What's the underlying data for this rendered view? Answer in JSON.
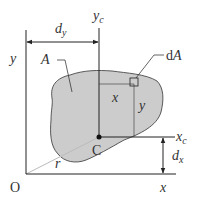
{
  "diagram": {
    "colors": {
      "line": "#222222",
      "area_fill": "#cccccc",
      "radius_line": "#bbbbbb",
      "text": "#333333"
    },
    "labels": {
      "y_axis": "y",
      "x_axis": "x",
      "origin": "O",
      "yc_axis_main": "y",
      "yc_axis_sub": "c",
      "xc_axis_main": "x",
      "xc_axis_sub": "c",
      "dy_main": "d",
      "dy_sub": "y",
      "dx_main": "d",
      "dx_sub": "x",
      "area": "A",
      "centroid": "C",
      "element_prefix": "d",
      "element_main": "A",
      "x_offset": "x",
      "y_offset": "y",
      "radius": "r"
    }
  }
}
